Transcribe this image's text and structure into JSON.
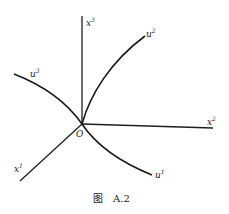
{
  "figure": {
    "caption_prefix": "图",
    "caption_number": "A.2",
    "origin_label": "O",
    "axes": [
      {
        "id": "x3",
        "base": "x",
        "sup": "3",
        "direction": "up"
      },
      {
        "id": "x2",
        "base": "x",
        "sup": "2",
        "direction": "right"
      },
      {
        "id": "x1",
        "base": "x",
        "sup": "1",
        "direction": "down-left"
      }
    ],
    "curves": [
      {
        "id": "u2",
        "base": "u",
        "sup": "2",
        "direction": "up-right"
      },
      {
        "id": "u3",
        "base": "u",
        "sup": "3",
        "direction": "up-left"
      },
      {
        "id": "u1",
        "base": "u",
        "sup": "1",
        "direction": "down-right"
      }
    ],
    "colors": {
      "ink": "#1a1a1a",
      "background": "#ffffff"
    }
  }
}
